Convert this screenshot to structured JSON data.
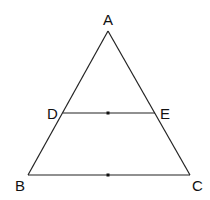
{
  "diagram": {
    "type": "geometry",
    "points": {
      "A": {
        "label": "A",
        "x": 108,
        "y": 31
      },
      "B": {
        "label": "B",
        "x": 28,
        "y": 175
      },
      "C": {
        "label": "C",
        "x": 190,
        "y": 175
      },
      "D": {
        "label": "D",
        "x": 63,
        "y": 113
      },
      "E": {
        "label": "E",
        "x": 155,
        "y": 113
      }
    },
    "segments": [
      [
        "A",
        "B"
      ],
      [
        "A",
        "C"
      ],
      [
        "B",
        "C"
      ],
      [
        "D",
        "E"
      ]
    ],
    "midpoints": [
      {
        "segment": "DE",
        "x": 108,
        "y": 113
      },
      {
        "segment": "BC",
        "x": 108,
        "y": 175
      }
    ],
    "colors": {
      "line": "#222222",
      "text": "#111111",
      "background": "#ffffff"
    }
  }
}
